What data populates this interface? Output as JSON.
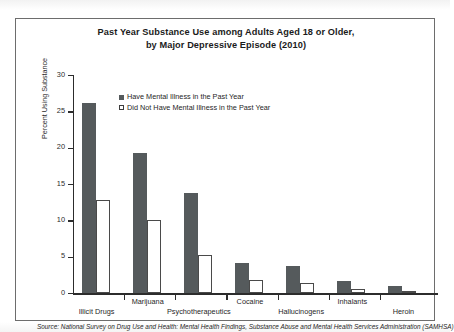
{
  "chart_data": {
    "type": "bar",
    "title": "Past Year Substance Use among Adults Aged 18 or Older, by Major Depressive Episode (2010)",
    "title_line1": "Past Year Substance Use among Adults Aged 18 or Older,",
    "title_line2": "by Major Depressive Episode (2010)",
    "xlabel": "",
    "ylabel": "Percent Using Substance",
    "ylim": [
      0,
      30
    ],
    "yticks": [
      0,
      5,
      10,
      15,
      20,
      25,
      30
    ],
    "ytick_labels": [
      "0",
      "5",
      "10",
      "15",
      "20",
      "25",
      "30"
    ],
    "grid": false,
    "legend_position": "top-center-inside",
    "categories": [
      "Illicit Drugs",
      "Marijuana",
      "Psychotherapeutics",
      "Cocaine",
      "Hallucinogens",
      "Inhalants",
      "Heroin"
    ],
    "series": [
      {
        "name": "Have Mental Illness in the Past Year",
        "color": "#555a5c",
        "style": "filled",
        "values": [
          26.2,
          19.2,
          13.8,
          4.1,
          3.7,
          1.7,
          1.0
        ]
      },
      {
        "name": "Did Not Have Mental Illness in the Past Year",
        "color": "#ffffff",
        "style": "hollow",
        "values": [
          12.8,
          10.0,
          5.2,
          1.8,
          1.4,
          0.6,
          0.3
        ]
      }
    ],
    "source": "Source: National Survey on Drug Use and Health: Mental Health Findings, Substance Abuse and Mental Health Services Administration (SAMHSA)"
  }
}
